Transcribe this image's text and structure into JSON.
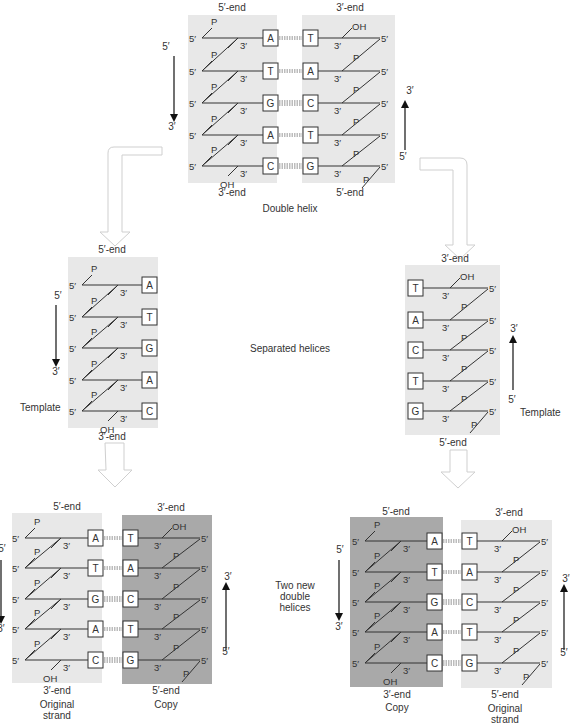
{
  "colors": {
    "light_strand_bg": "#e8e8e8",
    "dark_strand_bg": "#a9a9a9",
    "line": "#333333",
    "hollow_arrow": "#d8d8d8",
    "text": "#333333"
  },
  "labels": {
    "end5": "5′-end",
    "end3": "3′-end",
    "p": "P",
    "oh": "OH",
    "five": "5′",
    "three": "3′",
    "template": "Template",
    "double_helix": "Double helix",
    "separated_helices": "Separated helices",
    "two_new_line1": "Two new",
    "two_new_line2": "double",
    "two_new_line3": "helices",
    "original_line1": "Original",
    "original_line2": "strand",
    "copy": "Copy"
  },
  "sequences": {
    "left_strand": [
      "A",
      "T",
      "G",
      "A",
      "C"
    ],
    "right_strand": [
      "T",
      "A",
      "C",
      "T",
      "G"
    ]
  },
  "panels": {
    "double_helix": {
      "caption": "Double helix",
      "left_strand": {
        "top_label": "5′-end",
        "bottom_label": "3′-end",
        "bases": [
          "A",
          "T",
          "G",
          "A",
          "C"
        ]
      },
      "right_strand": {
        "top_label": "3′-end",
        "bottom_label": "5′-end",
        "bases": [
          "T",
          "A",
          "C",
          "T",
          "G"
        ]
      },
      "left_arrow": {
        "from": "5′",
        "to": "3′",
        "direction": "down"
      },
      "right_arrow": {
        "from": "5′",
        "to": "3′",
        "direction": "up"
      }
    },
    "separated_helices": {
      "caption": "Separated helices",
      "left_template": {
        "top_label": "5′-end",
        "bottom_label": "3′-end",
        "bases": [
          "A",
          "T",
          "G",
          "A",
          "C"
        ],
        "tag": "Template"
      },
      "right_template": {
        "top_label": "3′-end",
        "bottom_label": "5′-end",
        "bases": [
          "T",
          "A",
          "C",
          "T",
          "G"
        ],
        "tag": "Template"
      }
    },
    "two_new_double_helices": {
      "caption": "Two new double helices",
      "left_pair": {
        "original": {
          "top_label": "5′-end",
          "bottom_label": "3′-end",
          "caption": "Original strand",
          "bases": [
            "A",
            "T",
            "G",
            "A",
            "C"
          ]
        },
        "copy": {
          "top_label": "3′-end",
          "bottom_label": "5′-end",
          "caption": "Copy",
          "bases": [
            "T",
            "A",
            "C",
            "T",
            "G"
          ]
        }
      },
      "right_pair": {
        "copy": {
          "top_label": "5′-end",
          "bottom_label": "3′-end",
          "caption": "Copy",
          "bases": [
            "A",
            "T",
            "G",
            "A",
            "C"
          ]
        },
        "original": {
          "top_label": "3′-end",
          "bottom_label": "5′-end",
          "caption": "Original strand",
          "bases": [
            "T",
            "A",
            "C",
            "T",
            "G"
          ]
        }
      }
    }
  }
}
